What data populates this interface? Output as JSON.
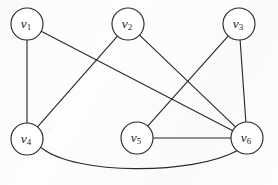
{
  "figure": {
    "name": "undirected-graph-diagram",
    "width": 278,
    "height": 185,
    "background_color": "#fdfdfc",
    "ink_color": "#2b2b2b",
    "node_fill_color": "#ffffff",
    "node_radius": 16
  },
  "graph_data": {
    "type": "node-link-diagram",
    "directed": false,
    "node_count": 6,
    "edge_count": 8,
    "nodes": [
      {
        "id": "v1",
        "label_base": "v",
        "label_sub": "1",
        "label": "v1",
        "cx": 27,
        "cy": 24,
        "r": 16,
        "degree": 2
      },
      {
        "id": "v2",
        "label_base": "v",
        "label_sub": "2",
        "label": "v2",
        "cx": 128,
        "cy": 24,
        "r": 16,
        "degree": 2
      },
      {
        "id": "v3",
        "label_base": "v",
        "label_sub": "3",
        "label": "v3",
        "cx": 239,
        "cy": 24,
        "r": 16,
        "degree": 2
      },
      {
        "id": "v4",
        "label_base": "v",
        "label_sub": "4",
        "label": "v4",
        "cx": 27,
        "cy": 139,
        "r": 16,
        "degree": 3
      },
      {
        "id": "v5",
        "label_base": "v",
        "label_sub": "5",
        "label": "v5",
        "cx": 137,
        "cy": 138,
        "r": 16,
        "degree": 2
      },
      {
        "id": "v6",
        "label_base": "v",
        "label_sub": "6",
        "label": "v6",
        "cx": 247,
        "cy": 138,
        "r": 16,
        "degree": 5
      }
    ],
    "edges": [
      {
        "id": "e1",
        "source": "v1",
        "target": "v4",
        "shape": "straight"
      },
      {
        "id": "e2",
        "source": "v1",
        "target": "v6",
        "shape": "straight"
      },
      {
        "id": "e3",
        "source": "v2",
        "target": "v4",
        "shape": "straight"
      },
      {
        "id": "e4",
        "source": "v2",
        "target": "v6",
        "shape": "straight"
      },
      {
        "id": "e5",
        "source": "v3",
        "target": "v5",
        "shape": "straight"
      },
      {
        "id": "e6",
        "source": "v3",
        "target": "v6",
        "shape": "straight"
      },
      {
        "id": "e7",
        "source": "v5",
        "target": "v6",
        "shape": "straight"
      },
      {
        "id": "e8",
        "source": "v4",
        "target": "v6",
        "shape": "curved-below",
        "curve_low_point": {
          "x": 140,
          "y": 169
        }
      }
    ]
  }
}
